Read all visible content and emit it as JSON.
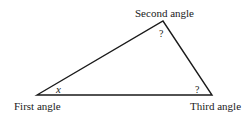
{
  "diagram": {
    "type": "triangle",
    "vertices": {
      "first": {
        "label": "First angle",
        "angle_label": "x"
      },
      "second": {
        "label": "Second angle",
        "angle_label": "?"
      },
      "third": {
        "label": "Third angle",
        "angle_label": "?"
      }
    },
    "stroke_color": "#1a1a1a",
    "background_color": "#ffffff"
  }
}
